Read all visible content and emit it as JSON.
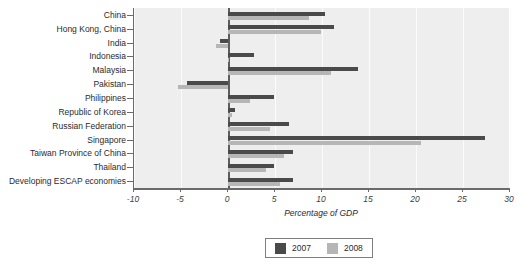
{
  "chart_data": {
    "type": "bar",
    "orientation": "horizontal",
    "title": "",
    "xlabel": "Percentage of GDP",
    "ylabel": "",
    "xlim": [
      -10,
      30
    ],
    "xticks": [
      -10,
      -5,
      0,
      5,
      10,
      15,
      20,
      25,
      30
    ],
    "xtick_labels": [
      "-10",
      "-5",
      "0",
      "5",
      "10",
      "15",
      "20",
      "25",
      "30"
    ],
    "grid": true,
    "legend_position": "bottom-center",
    "categories": [
      "China",
      "Hong Kong, China",
      "India",
      "Indonesia",
      "Malaysia",
      "Pakistan",
      "Philippines",
      "Republic of Korea",
      "Russian Federation",
      "Singapore",
      "Taiwan Province of China",
      "Thailand",
      "Developing ESCAP economies"
    ],
    "series": [
      {
        "name": "2007",
        "color": "#4a4a4a",
        "values": [
          10.3,
          11.3,
          -0.9,
          2.8,
          13.8,
          -4.4,
          4.9,
          0.7,
          6.5,
          27.3,
          6.9,
          4.9,
          6.9
        ]
      },
      {
        "name": "2008",
        "color": "#b6b6b6",
        "values": [
          8.6,
          9.9,
          -1.3,
          0.1,
          11.0,
          -5.3,
          2.3,
          0.4,
          4.5,
          20.5,
          6.0,
          4.0,
          5.5
        ]
      }
    ]
  },
  "legend": {
    "entries": [
      {
        "label": "2007",
        "color": "#4a4a4a"
      },
      {
        "label": "2008",
        "color": "#b6b6b6"
      }
    ]
  }
}
